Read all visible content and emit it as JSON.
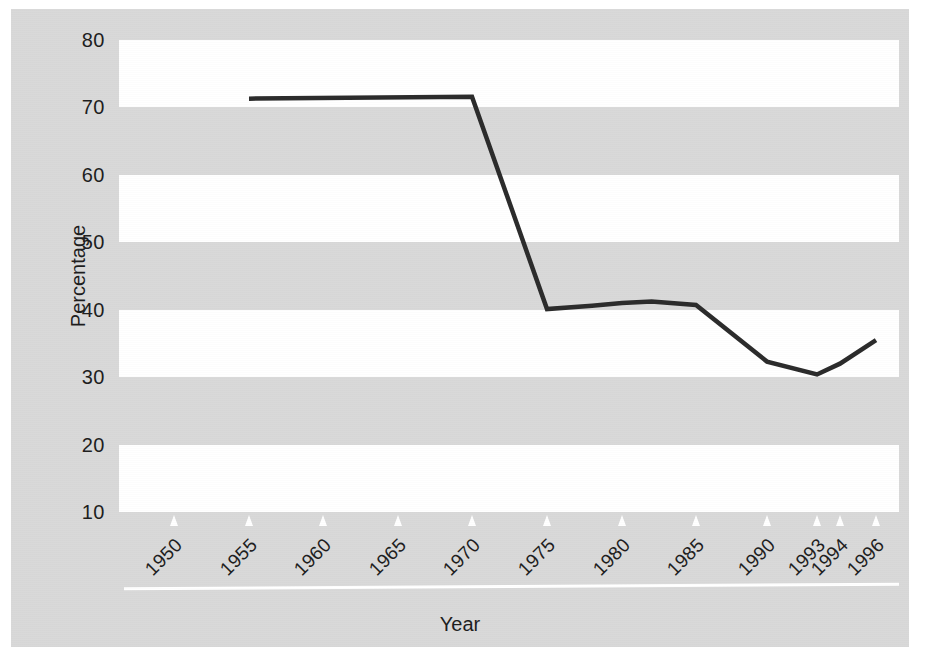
{
  "chart_data": {
    "type": "line",
    "title": "",
    "xlabel": "Year",
    "ylabel": "Percentage",
    "ylim": [
      10,
      80
    ],
    "yticks": [
      80,
      70,
      60,
      50,
      40,
      30,
      20,
      10
    ],
    "xlim": [
      1948,
      1997
    ],
    "xticks": [
      1950,
      1955,
      1960,
      1965,
      1970,
      1975,
      1980,
      1985,
      1990,
      1993,
      1994,
      1996
    ],
    "xtick_labels": [
      "1950",
      "1955",
      "1960",
      "1965",
      "1970",
      "1975",
      "1980",
      "1985",
      "1990",
      "1993",
      "1994",
      "1996"
    ],
    "grid": false,
    "banded_background": true,
    "band_ranges": [
      [
        70,
        80
      ],
      [
        50,
        60
      ],
      [
        30,
        40
      ],
      [
        10,
        20
      ]
    ],
    "legend": null,
    "series": [
      {
        "name": "Percentage",
        "color": "#2b2b2b",
        "x": [
          1955,
          1970,
          1975,
          1978,
          1980,
          1982,
          1985,
          1990,
          1993,
          1994,
          1996
        ],
        "values": [
          71.3,
          71.6,
          40.1,
          40.6,
          41.0,
          41.2,
          40.7,
          32.3,
          30.4,
          32.0,
          35.5
        ]
      }
    ]
  },
  "axis": {
    "y_label": "Percentage",
    "x_label": "Year",
    "y_tick_labels": [
      "80",
      "70",
      "60",
      "50",
      "40",
      "30",
      "20",
      "10"
    ],
    "x_tick_labels": [
      "1950",
      "1955",
      "1960",
      "1965",
      "1970",
      "1975",
      "1980",
      "1985",
      "1990",
      "1993",
      "1994",
      "1996"
    ]
  },
  "colors": {
    "panel_background": "#d9d9d9",
    "band_white": "#ffffff",
    "series_line": "#2b2b2b",
    "text": "#1d1d1d",
    "rule": "#ffffff"
  }
}
